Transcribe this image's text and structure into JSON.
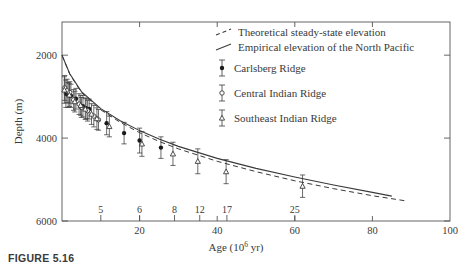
{
  "figure": {
    "caption_label": "FIGURE 5.16",
    "title": ""
  },
  "axes": {
    "x": {
      "label": "Age (10",
      "label_sup": "6",
      "label_tail": " yr)",
      "label_full": "Age (10^6 yr)",
      "min": 0,
      "max": 100,
      "ticks": [
        0,
        20,
        40,
        60,
        80,
        100
      ],
      "tick_labels": [
        "",
        "20",
        "40",
        "60",
        "80",
        "100"
      ],
      "secondary_name": "magnetic-anomaly-numbers",
      "secondary_ticks": [
        10,
        20,
        29,
        35.5,
        42.5,
        60
      ],
      "secondary_labels": [
        "5",
        "6",
        "8",
        "12",
        "17",
        "25"
      ]
    },
    "y": {
      "label": "Depth (m)",
      "min": 1200,
      "max": 6000,
      "ticks": [
        2000,
        4000,
        6000
      ],
      "tick_labels": [
        "2000",
        "4000",
        "6000"
      ],
      "inverted": true
    }
  },
  "legend": {
    "lines": [
      {
        "key": "theoretical",
        "style": "dashed",
        "label": "Theoretical steady-state elevation"
      },
      {
        "key": "empirical",
        "style": "solid",
        "label": "Empirical elevation of the North Pacific"
      }
    ],
    "markers": [
      {
        "key": "carlsberg",
        "symbol": "filled-circle",
        "label": "Carlsberg Ridge"
      },
      {
        "key": "central-indian",
        "symbol": "open-circle",
        "label": "Central Indian Ridge"
      },
      {
        "key": "southeast-indian",
        "symbol": "open-triangle",
        "label": "Southeast Indian Ridge"
      }
    ]
  },
  "colors": {
    "ink": "#3a3a3a",
    "axis": "#555555",
    "marker_fill": "#1a1a1a",
    "background": "#ffffff"
  },
  "chart_data": {
    "type": "scatter",
    "title": "",
    "xlabel": "Age (10^6 yr)",
    "ylabel": "Depth (m)",
    "xlim": [
      0,
      100
    ],
    "ylim": [
      6000,
      1200
    ],
    "y_inverted": true,
    "grid": false,
    "legend_position": "top-right",
    "series": [
      {
        "name": "Carlsberg Ridge",
        "symbol": "filled-circle",
        "points": [
          {
            "x": 1.0,
            "y": 2930,
            "yerr": 330
          },
          {
            "x": 1.6,
            "y": 2960,
            "yerr": 300
          },
          {
            "x": 2.3,
            "y": 2980,
            "yerr": 280
          },
          {
            "x": 3.6,
            "y": 3050,
            "yerr": 250
          },
          {
            "x": 5.4,
            "y": 3230,
            "yerr": 260
          },
          {
            "x": 6.2,
            "y": 3280,
            "yerr": 250
          },
          {
            "x": 7.0,
            "y": 3300,
            "yerr": 240
          },
          {
            "x": 11.5,
            "y": 3640,
            "yerr": 280
          },
          {
            "x": 16.0,
            "y": 3880,
            "yerr": 260
          },
          {
            "x": 20.0,
            "y": 4060,
            "yerr": 300
          },
          {
            "x": 25.5,
            "y": 4230,
            "yerr": 260
          }
        ]
      },
      {
        "name": "Central Indian Ridge",
        "symbol": "open-circle",
        "points": [
          {
            "x": 0.7,
            "y": 2790,
            "yerr": 300
          },
          {
            "x": 1.3,
            "y": 2860,
            "yerr": 280
          },
          {
            "x": 2.0,
            "y": 2900,
            "yerr": 260
          },
          {
            "x": 3.0,
            "y": 3080,
            "yerr": 250
          },
          {
            "x": 4.4,
            "y": 3180,
            "yerr": 250
          },
          {
            "x": 5.0,
            "y": 3260,
            "yerr": 240
          },
          {
            "x": 6.6,
            "y": 3340,
            "yerr": 250
          },
          {
            "x": 8.2,
            "y": 3470,
            "yerr": 260
          },
          {
            "x": 9.4,
            "y": 3560,
            "yerr": 250
          }
        ]
      },
      {
        "name": "Southeast Indian Ridge",
        "symbol": "open-triangle",
        "points": [
          {
            "x": 0.6,
            "y": 2840,
            "yerr": 320
          },
          {
            "x": 1.9,
            "y": 2960,
            "yerr": 280
          },
          {
            "x": 3.3,
            "y": 3120,
            "yerr": 250
          },
          {
            "x": 4.8,
            "y": 3210,
            "yerr": 240
          },
          {
            "x": 6.0,
            "y": 3300,
            "yerr": 250
          },
          {
            "x": 7.6,
            "y": 3420,
            "yerr": 250
          },
          {
            "x": 9.0,
            "y": 3530,
            "yerr": 260
          },
          {
            "x": 12.2,
            "y": 3720,
            "yerr": 250
          },
          {
            "x": 20.6,
            "y": 4140,
            "yerr": 300
          },
          {
            "x": 28.6,
            "y": 4380,
            "yerr": 280
          },
          {
            "x": 35.0,
            "y": 4560,
            "yerr": 300
          },
          {
            "x": 42.3,
            "y": 4810,
            "yerr": 290
          },
          {
            "x": 62.0,
            "y": 5160,
            "yerr": 270
          }
        ]
      }
    ],
    "curves": [
      {
        "name": "Theoretical steady-state elevation",
        "style": "dashed",
        "points": [
          {
            "x": 0,
            "y": 2000
          },
          {
            "x": 2,
            "y": 2460
          },
          {
            "x": 5,
            "y": 2900
          },
          {
            "x": 10,
            "y": 3320
          },
          {
            "x": 15,
            "y": 3620
          },
          {
            "x": 20,
            "y": 3870
          },
          {
            "x": 25,
            "y": 4080
          },
          {
            "x": 30,
            "y": 4260
          },
          {
            "x": 40,
            "y": 4560
          },
          {
            "x": 50,
            "y": 4810
          },
          {
            "x": 60,
            "y": 5030
          },
          {
            "x": 70,
            "y": 5220
          },
          {
            "x": 80,
            "y": 5390
          },
          {
            "x": 89,
            "y": 5520
          }
        ]
      },
      {
        "name": "Empirical elevation of the North Pacific",
        "style": "solid",
        "points": [
          {
            "x": 0,
            "y": 2000
          },
          {
            "x": 2,
            "y": 2450
          },
          {
            "x": 5,
            "y": 2880
          },
          {
            "x": 10,
            "y": 3290
          },
          {
            "x": 15,
            "y": 3580
          },
          {
            "x": 20,
            "y": 3820
          },
          {
            "x": 25,
            "y": 4020
          },
          {
            "x": 30,
            "y": 4200
          },
          {
            "x": 40,
            "y": 4490
          },
          {
            "x": 50,
            "y": 4730
          },
          {
            "x": 60,
            "y": 4940
          },
          {
            "x": 70,
            "y": 5130
          },
          {
            "x": 80,
            "y": 5310
          },
          {
            "x": 85,
            "y": 5400
          }
        ]
      }
    ]
  }
}
